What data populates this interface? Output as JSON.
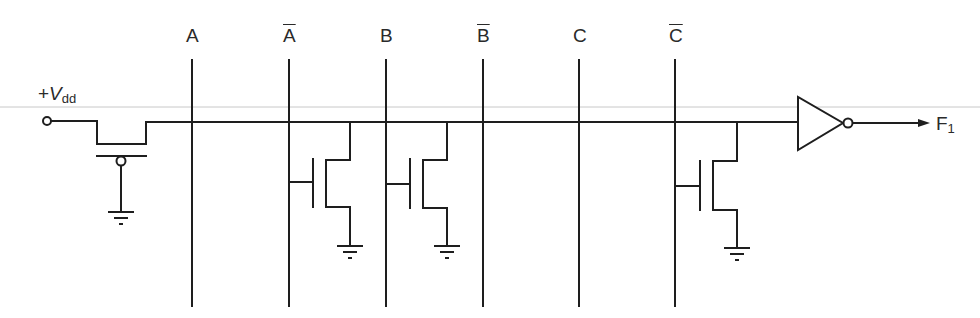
{
  "diagram": {
    "supply_label": {
      "prefix": "+",
      "symbol": "V",
      "subscript": "dd"
    },
    "input_lines": [
      {
        "label": "A",
        "complemented": false,
        "x": 192,
        "has_transistor": false
      },
      {
        "label": "A",
        "complemented": true,
        "x": 289,
        "has_transistor": true
      },
      {
        "label": "B",
        "complemented": false,
        "x": 386,
        "has_transistor": false
      },
      {
        "label": "B",
        "complemented": true,
        "x": 483,
        "has_transistor": true
      },
      {
        "label": "C",
        "complemented": false,
        "x": 579,
        "has_transistor": false
      },
      {
        "label": "C",
        "complemented": true,
        "x": 675,
        "has_transistor": true
      }
    ],
    "output_label": {
      "symbol": "F",
      "subscript": "1"
    },
    "components": {
      "pull_up": "pmos-with-grounded-gate",
      "pull_down": "nmos-transistor",
      "output": "inverter",
      "ground": "ground-symbol"
    },
    "colors": {
      "line": "#1e1e1e",
      "rule": "#c8c8c8",
      "text": "#2a2a2a"
    }
  }
}
